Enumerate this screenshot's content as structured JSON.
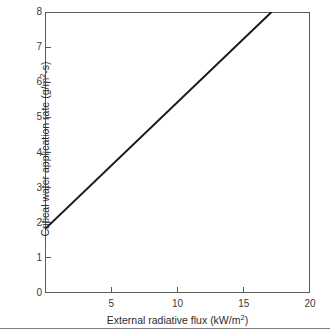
{
  "chart_data": {
    "type": "line",
    "title": "",
    "xlabel_parts": {
      "main": "External radiative flux (kW/m",
      "sup": "2",
      "tail": ")"
    },
    "ylabel_parts": {
      "main": "Critical water application rate (g/m",
      "sup": "2",
      "tail": "-s)"
    },
    "xlabel": "External radiative flux (kW/m2)",
    "ylabel": "Critical water application rate (g/m2-s)",
    "xlim": [
      0,
      20
    ],
    "ylim": [
      0,
      8
    ],
    "grid": false,
    "legend": "none",
    "x_ticks": [
      0,
      5,
      10,
      15,
      20
    ],
    "x_tick_labels": [
      "",
      "5",
      "10",
      "15",
      "20"
    ],
    "y_ticks": [
      0,
      1,
      2,
      3,
      4,
      5,
      6,
      7,
      8
    ],
    "y_tick_labels": [
      "0",
      "1",
      "2",
      "3",
      "4",
      "5",
      "6",
      "7",
      "8"
    ],
    "series": [
      {
        "name": "critical water application rate",
        "x": [
          0,
          17.1
        ],
        "values": [
          1.82,
          8.0
        ],
        "slope": 0.363,
        "intercept": 1.82,
        "color": "#1a1a1a",
        "line_width": 2,
        "style": "solid"
      }
    ],
    "annotations": []
  },
  "axis_colors": {
    "frame": "#5a5a5a",
    "tick": "#5a5a5a",
    "text": "#2b2b2b",
    "rule": "#808080"
  }
}
